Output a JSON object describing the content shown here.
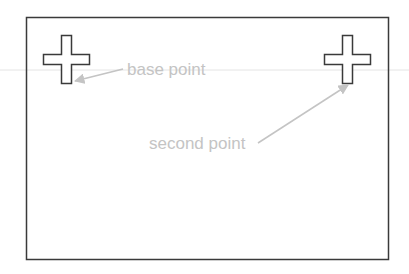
{
  "labels": {
    "base_point": "base point",
    "second_point": "second point"
  },
  "colors": {
    "outline": "#3a3a3a",
    "label": "#c4c4c4",
    "leader": "#c4c4c4",
    "guide": "#e4e4e4"
  },
  "icons": {
    "left_marker": "cross-icon",
    "right_marker": "cross-icon"
  }
}
